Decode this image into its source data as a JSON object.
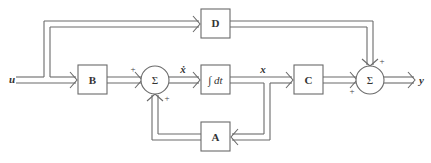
{
  "diagram": {
    "input_label": "u",
    "output_label": "y",
    "state_label": "x",
    "state_derivative_label": "ẋ",
    "blocks": [
      {
        "id": "B",
        "label": "B"
      },
      {
        "id": "D",
        "label": "D"
      },
      {
        "id": "integrator",
        "label": "∫ dt"
      },
      {
        "id": "C",
        "label": "C"
      },
      {
        "id": "A",
        "label": "A"
      }
    ],
    "summing_junctions": [
      {
        "id": "sum1",
        "symbol": "Σ",
        "signs": [
          "+",
          "+"
        ]
      },
      {
        "id": "sum2",
        "symbol": "Σ",
        "signs": [
          "+",
          "+"
        ]
      }
    ],
    "edges": [
      {
        "from": "u",
        "to": "B"
      },
      {
        "from": "u",
        "to": "D"
      },
      {
        "from": "B",
        "to": "sum1",
        "sign": "+"
      },
      {
        "from": "A",
        "to": "sum1",
        "sign": "+"
      },
      {
        "from": "sum1",
        "to": "integrator",
        "label": "ẋ"
      },
      {
        "from": "integrator",
        "to": "C",
        "label": "x"
      },
      {
        "from": "integrator",
        "to": "A",
        "label": "x"
      },
      {
        "from": "C",
        "to": "sum2",
        "sign": "+"
      },
      {
        "from": "D",
        "to": "sum2",
        "sign": "+"
      },
      {
        "from": "sum2",
        "to": "y"
      }
    ]
  }
}
